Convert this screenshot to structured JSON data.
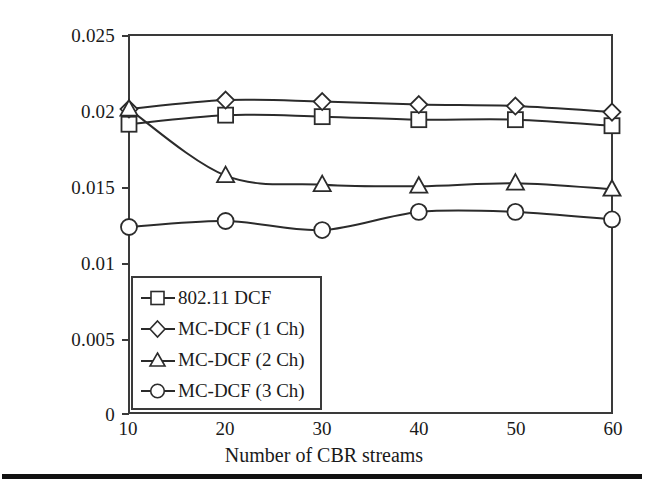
{
  "chart_data": {
    "type": "line",
    "title": "",
    "xlabel": "Number of CBR streams",
    "ylabel": "Channel access delay (s)",
    "x": [
      10,
      20,
      30,
      40,
      50,
      60
    ],
    "xlim": [
      10,
      60
    ],
    "ylim": [
      0,
      0.025
    ],
    "xticks": [
      "10",
      "20",
      "30",
      "40",
      "50",
      "60"
    ],
    "yticks": [
      "0",
      "0.005",
      "0.01",
      "0.015",
      "0.02",
      "0.025"
    ],
    "ytick_values": [
      0,
      0.005,
      0.01,
      0.015,
      0.02,
      0.025
    ],
    "grid": false,
    "legend_position": "lower left (inside axes)",
    "series": [
      {
        "name": "802.11 DCF",
        "marker": "square",
        "values": [
          0.0191,
          0.0197,
          0.0196,
          0.0194,
          0.0194,
          0.019
        ]
      },
      {
        "name": "MC-DCF (1 Ch)",
        "marker": "diamond",
        "values": [
          0.0201,
          0.0207,
          0.0206,
          0.0204,
          0.0203,
          0.0199
        ]
      },
      {
        "name": "MC-DCF (2 Ch)",
        "marker": "triangle",
        "values": [
          0.0201,
          0.0157,
          0.0151,
          0.015,
          0.0152,
          0.0148
        ]
      },
      {
        "name": "MC-DCF (3 Ch)",
        "marker": "circle",
        "values": [
          0.0123,
          0.0127,
          0.0121,
          0.0133,
          0.0133,
          0.0128
        ]
      }
    ]
  },
  "axes": {
    "y_title": "Channel access delay (s)",
    "x_title": "Number of CBR streams",
    "y_tick_labels": [
      "0.025",
      "0.02",
      "0.015",
      "0.01",
      "0.005",
      "0"
    ],
    "x_tick_labels": [
      "10",
      "20",
      "30",
      "40",
      "50",
      "60"
    ]
  },
  "legend": {
    "items": [
      {
        "label": "802.11 DCF",
        "marker": "square-marker-icon"
      },
      {
        "label": "MC-DCF (1 Ch)",
        "marker": "diamond-marker-icon"
      },
      {
        "label": "MC-DCF (2 Ch)",
        "marker": "triangle-marker-icon"
      },
      {
        "label": "MC-DCF (3 Ch)",
        "marker": "circle-marker-icon"
      }
    ]
  },
  "colors": {
    "line": "#2b2b2b",
    "frame": "#3a3a3a",
    "marker_fill": "#ffffff",
    "text": "#1a1a1a",
    "rule": "#111111",
    "background": "#ffffff"
  }
}
